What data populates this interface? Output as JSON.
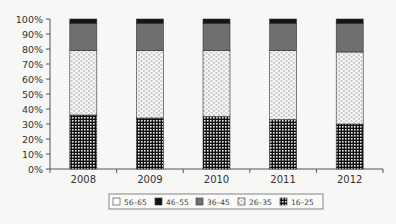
{
  "chart_data": {
    "type": "bar",
    "stacked": true,
    "normalized_percent": true,
    "title": "",
    "xlabel": "",
    "ylabel": "",
    "ylim": [
      0,
      100
    ],
    "yticks": [
      "0%",
      "10%",
      "20%",
      "30%",
      "40%",
      "50%",
      "60%",
      "70%",
      "80%",
      "90%",
      "100%"
    ],
    "categories": [
      "2008",
      "2009",
      "2010",
      "2011",
      "2012"
    ],
    "series": [
      {
        "name": "16–25",
        "pattern": "grid",
        "values": [
          36,
          34,
          35,
          33,
          30
        ]
      },
      {
        "name": "26–35",
        "pattern": "dotted",
        "values": [
          43,
          45,
          44,
          46,
          48
        ]
      },
      {
        "name": "36–45",
        "pattern": "gray",
        "values": [
          18,
          18,
          18,
          18,
          19
        ]
      },
      {
        "name": "46–55",
        "pattern": "black",
        "values": [
          3,
          3,
          3,
          3,
          3
        ]
      },
      {
        "name": "56–65",
        "pattern": "white",
        "values": [
          0,
          0,
          0,
          0,
          0
        ]
      }
    ],
    "legend": {
      "position": "bottom",
      "entries": [
        "56–65",
        "46–55",
        "36–45",
        "26–35",
        "16–25"
      ]
    },
    "grid": false
  },
  "colors": {
    "gray": "#6f6f6f",
    "black": "#151515",
    "axis": "#555555",
    "background": "#f7f7f5"
  }
}
